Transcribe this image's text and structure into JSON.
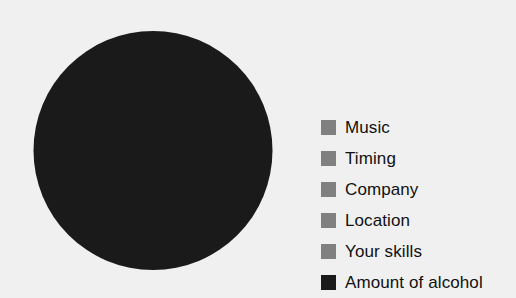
{
  "background_color": "#f0f0f0",
  "chart_data": {
    "type": "pie",
    "title": "",
    "subtitle": "",
    "xlabel": "",
    "ylabel": "",
    "grid": false,
    "legend_position": "right",
    "categories": [
      "Music",
      "Timing",
      "Company",
      "Location",
      "Your skills",
      "Amount of alcohol"
    ],
    "values": [
      0,
      0,
      0,
      0,
      0,
      100
    ],
    "value_unit": "%",
    "colors": [
      "#808080",
      "#808080",
      "#808080",
      "#808080",
      "#808080",
      "#1a1a1a"
    ],
    "slices": [
      {
        "label": "Music",
        "value": 0,
        "color": "#808080"
      },
      {
        "label": "Timing",
        "value": 0,
        "color": "#808080"
      },
      {
        "label": "Company",
        "value": 0,
        "color": "#808080"
      },
      {
        "label": "Location",
        "value": 0,
        "color": "#808080"
      },
      {
        "label": "Your skills",
        "value": 0,
        "color": "#808080"
      },
      {
        "label": "Amount of alcohol",
        "value": 100,
        "color": "#1a1a1a"
      }
    ],
    "annotations": []
  },
  "pie": {
    "center_x": 120,
    "center_y": 120.5,
    "radius": 119.5,
    "dominant_color": "#1a1a1a"
  },
  "legend": {
    "items": [
      {
        "label": "Music",
        "color": "#808080"
      },
      {
        "label": "Timing",
        "color": "#808080"
      },
      {
        "label": "Company",
        "color": "#808080"
      },
      {
        "label": "Location",
        "color": "#808080"
      },
      {
        "label": "Your skills",
        "color": "#808080"
      },
      {
        "label": "Amount of alcohol",
        "color": "#1a1a1a"
      }
    ]
  }
}
